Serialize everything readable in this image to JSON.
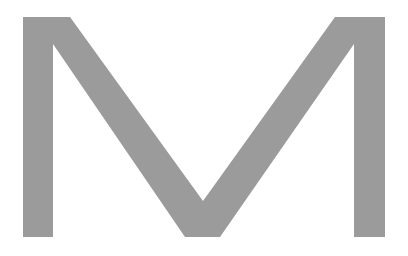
{
  "glyph": {
    "character": "M",
    "color": "#9b9b9b",
    "background": "#ffffff"
  }
}
